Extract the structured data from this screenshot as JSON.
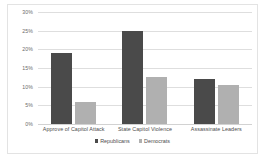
{
  "chart_data": {
    "type": "bar",
    "title": "",
    "subtitle": "",
    "xlabel": "",
    "ylabel": "",
    "categories": [
      "Approve of Capitol Attack",
      "State Capitol Violence",
      "Assassinate Leaders"
    ],
    "series": [
      {
        "name": "Republicans",
        "color": "#4a4a4a",
        "values": [
          19,
          25,
          12
        ]
      },
      {
        "name": "Democrats",
        "color": "#b0b0b0",
        "values": [
          6,
          12.5,
          10.5
        ]
      }
    ],
    "ylim": [
      0,
      30
    ],
    "ytick_step": 5,
    "ytick_labels": [
      "30%",
      "25%",
      "20%",
      "15%",
      "10%",
      "5%",
      "0%"
    ],
    "ytick_values": [
      30,
      25,
      20,
      15,
      10,
      5,
      0
    ],
    "grid": true,
    "legend_position": "bottom",
    "value_unit": "%"
  },
  "legend": {
    "items": [
      {
        "label": "Republicans"
      },
      {
        "label": "Democrats"
      }
    ]
  }
}
